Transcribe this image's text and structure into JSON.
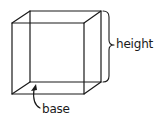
{
  "diagram": {
    "type": "rectangular-prism",
    "labels": {
      "height": "height",
      "base": "base"
    },
    "colors": {
      "stroke": "#1a1a1a",
      "background": "#ffffff"
    }
  }
}
